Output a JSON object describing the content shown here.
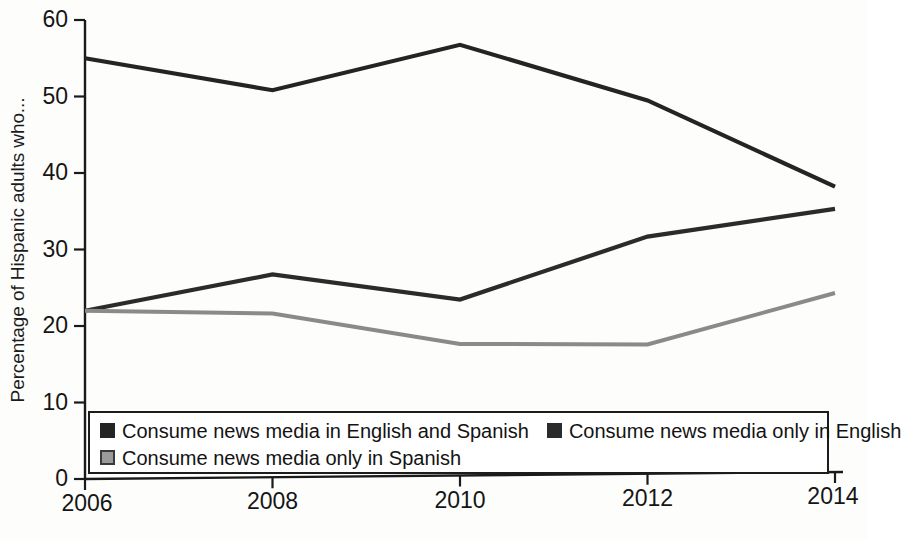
{
  "chart_data": {
    "type": "line",
    "title": "",
    "xlabel": "",
    "ylabel": "Percentage of Hispanic adults who...",
    "x": [
      2006,
      2008,
      2010,
      2012,
      2014
    ],
    "xtick_labels": [
      "2006",
      "2008",
      "2010",
      "2012",
      "2014"
    ],
    "ytick_labels": [
      "0",
      "10",
      "20",
      "30",
      "40",
      "50",
      "60"
    ],
    "yticks": [
      0,
      10,
      20,
      30,
      40,
      50,
      60
    ],
    "ylim": [
      0,
      60
    ],
    "xlim": [
      2006,
      2014
    ],
    "grid": false,
    "legend_position": "bottom-inside",
    "series": [
      {
        "name": "Consume news media in English and Spanish",
        "color": "#242424",
        "swatch_fill": "#242424",
        "swatch_border": "#242424",
        "values": [
          55.0,
          50.6,
          56.3,
          48.8,
          37.3
        ]
      },
      {
        "name": "Consume news media only in English",
        "color": "#2b2b2b",
        "swatch_fill": "#2b2b2b",
        "swatch_border": "#2b2b2b",
        "values": [
          22.0,
          26.5,
          23.0,
          31.0,
          34.4
        ]
      },
      {
        "name": "Consume news media only in Spanish",
        "color": "#8a8a8a",
        "swatch_fill": "#9a9a9a",
        "swatch_border": "#3a3a3a",
        "values": [
          22.0,
          21.4,
          17.2,
          16.9,
          23.4
        ]
      }
    ]
  },
  "axis": {
    "line_color": "#1a1a1a",
    "y_title": "Percentage of Hispanic adults who..."
  },
  "legend": {
    "row1": [
      "Consume news media in English and Spanish",
      "Consume news media only in English"
    ],
    "row2": [
      "Consume news media only in Spanish"
    ]
  }
}
